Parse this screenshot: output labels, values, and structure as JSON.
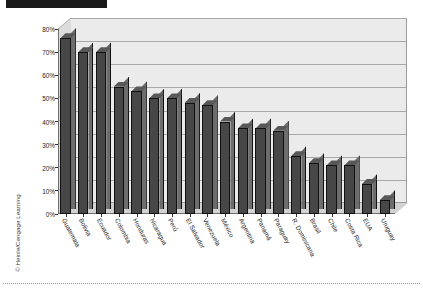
{
  "figure": {
    "copyright": "© Heinle/Cengage Learning",
    "top_marker_label": ""
  },
  "chart_data": {
    "type": "bar",
    "title": "",
    "subtitle": "",
    "xlabel": "",
    "ylabel": "",
    "ylim": [
      0,
      80
    ],
    "ytick_labels": [
      "0%",
      "10%",
      "20%",
      "30%",
      "40%",
      "50%",
      "60%",
      "70%",
      "80%"
    ],
    "ytick_values": [
      0,
      10,
      20,
      30,
      40,
      50,
      60,
      70,
      80
    ],
    "grid": true,
    "legend": "none",
    "style": "3d-column",
    "bar_color": "#474747",
    "bar_side_color": "#6d6d6d",
    "plot_background": "#ebebeb",
    "categories": [
      "Guatemala",
      "Bolivia",
      "Ecuador",
      "Colombia",
      "Honduras",
      "Nicaragua",
      "Perú",
      "El Salvador",
      "Venezuela",
      "México",
      "Argentina",
      "Panamá",
      "Paraguay",
      "R. Dominicana",
      "Brasil",
      "Chile",
      "Costa Rica",
      "EUA",
      "Uruguay"
    ],
    "values": [
      76,
      70,
      70,
      55,
      53,
      50,
      50,
      48,
      47,
      40,
      37,
      37,
      36,
      25,
      22,
      21,
      21,
      13,
      6
    ]
  }
}
